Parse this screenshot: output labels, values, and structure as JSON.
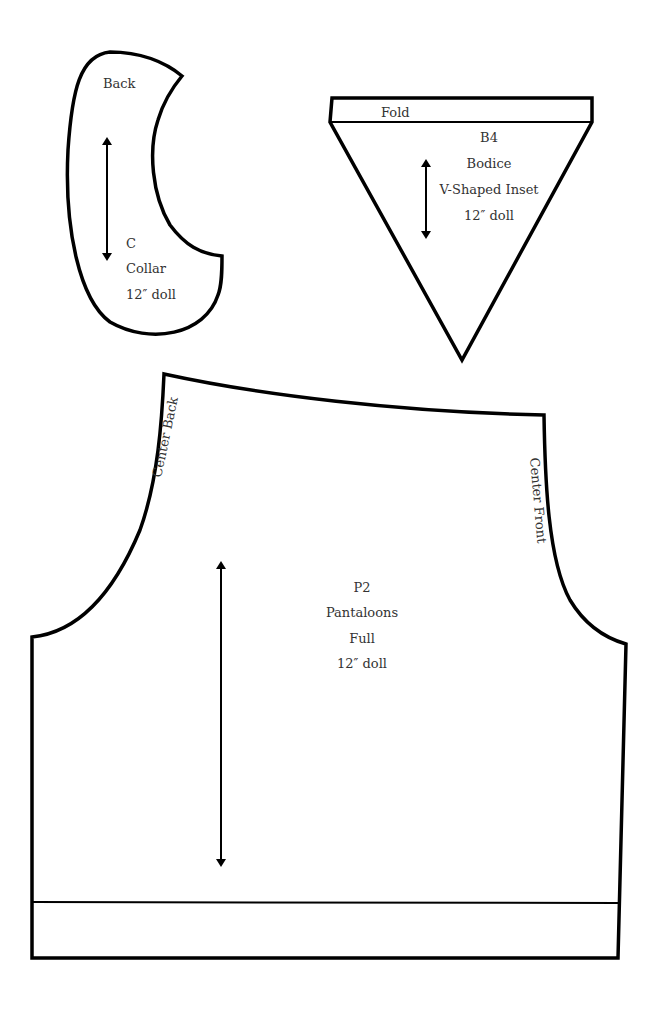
{
  "pieces": {
    "collar": {
      "top_label": "Back",
      "code": "C",
      "name": "Collar",
      "size": "12″ doll"
    },
    "bodice_inset": {
      "fold_label": "Fold",
      "code": "B4",
      "name": "Bodice",
      "subname": "V-Shaped Inset",
      "size": "12″ doll"
    },
    "pantaloons": {
      "left_edge_label": "Center Back",
      "right_edge_label": "Center Front",
      "code": "P2",
      "name": "Pantaloons",
      "subname": "Full",
      "size": "12″ doll"
    }
  },
  "colors": {
    "outline": "#000000",
    "text": "#333333",
    "background": "#ffffff"
  }
}
